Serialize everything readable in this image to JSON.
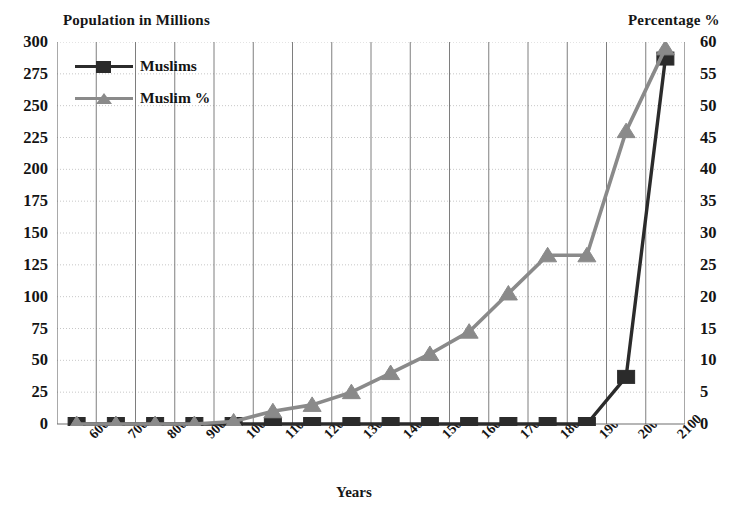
{
  "chart_data": {
    "type": "line",
    "title": "",
    "xlabel": "Years",
    "ylabel": "Population in Millions",
    "y2label": "Percentage %",
    "grid": true,
    "legend_position": "top-left",
    "categories": [
      "600",
      "700",
      "800",
      "900",
      "1000",
      "1100",
      "1200",
      "1300",
      "1400",
      "1500",
      "1600",
      "1700",
      "1800",
      "1900",
      "2000",
      "2100"
    ],
    "ylim": [
      0,
      300
    ],
    "yticks": [
      "0",
      "25",
      "50",
      "75",
      "100",
      "125",
      "150",
      "175",
      "200",
      "225",
      "250",
      "275",
      "300"
    ],
    "y2lim": [
      0,
      60
    ],
    "y2ticks": [
      "0",
      "5",
      "10",
      "15",
      "20",
      "25",
      "30",
      "35",
      "40",
      "45",
      "50",
      "55",
      "60"
    ],
    "series": [
      {
        "name": "Muslims",
        "axis": "left",
        "color": "#2b2b2b",
        "marker": "square",
        "values": [
          0,
          0,
          0,
          0,
          0,
          0,
          0,
          0,
          0,
          0,
          0,
          0,
          0,
          0,
          37,
          287
        ]
      },
      {
        "name": "Muslim %",
        "axis": "right",
        "color": "#8a8a8a",
        "marker": "triangle",
        "values": [
          0,
          0,
          0,
          0,
          0.4,
          2,
          3,
          5,
          8,
          11,
          14.5,
          20.5,
          26.5,
          26.5,
          46,
          59
        ]
      }
    ]
  },
  "legend": {
    "items": [
      {
        "label": "Muslims"
      },
      {
        "label": "Muslim %"
      }
    ]
  }
}
